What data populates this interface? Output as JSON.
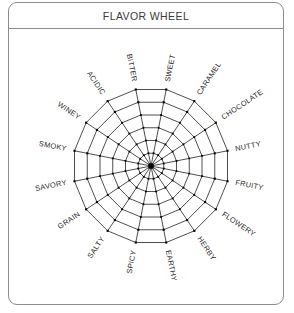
{
  "card": {
    "title": "FLAVOR WHEEL"
  },
  "wheel": {
    "center_x": 142,
    "center_y": 137,
    "outer_radius": 78,
    "ring_count": 6,
    "spoke_count": 16,
    "label_radius": 86,
    "colors": {
      "line": "#2f2f2f",
      "vertex": "#000000",
      "label": "#2b2b2b",
      "border": "#8d8d8d",
      "background": "#ffffff"
    },
    "sectors": [
      {
        "label": "BITTER",
        "angle_deg": -101.25
      },
      {
        "label": "SWEET",
        "angle_deg": -78.75
      },
      {
        "label": "CARAMEL",
        "angle_deg": -56.25
      },
      {
        "label": "CHOCOLATE",
        "angle_deg": -33.75
      },
      {
        "label": "NUTTY",
        "angle_deg": -11.25
      },
      {
        "label": "FRUITY",
        "angle_deg": 11.25
      },
      {
        "label": "FLOWERY",
        "angle_deg": 33.75
      },
      {
        "label": "HERBY",
        "angle_deg": 56.25
      },
      {
        "label": "EARTHY",
        "angle_deg": 78.75
      },
      {
        "label": "SPICY",
        "angle_deg": 101.25
      },
      {
        "label": "SALTY",
        "angle_deg": 123.75
      },
      {
        "label": "GRAIN",
        "angle_deg": 146.25
      },
      {
        "label": "SAVORY",
        "angle_deg": 168.75
      },
      {
        "label": "SMOKY",
        "angle_deg": 191.25
      },
      {
        "label": "WINEY",
        "angle_deg": 213.75
      },
      {
        "label": "ACIDIC",
        "angle_deg": 236.25
      }
    ]
  }
}
